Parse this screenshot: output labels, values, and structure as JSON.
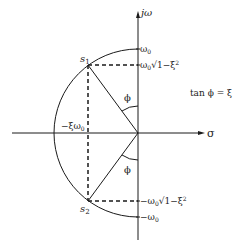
{
  "diagram": {
    "axes": {
      "vertical_label": "jω",
      "horizontal_label": "σ"
    },
    "points": {
      "upper_pole": "s",
      "upper_pole_sub": "1",
      "lower_pole": "s",
      "lower_pole_sub": "2"
    },
    "ticks": {
      "top_omega": "ω",
      "top_omega_sub": "0",
      "upper_damped": "ω",
      "upper_damped_sub": "0",
      "upper_damped_root": "√1−ξ",
      "upper_damped_exp": "2",
      "lower_damped": "−ω",
      "lower_damped_sub": "0",
      "lower_damped_root": "√1−ξ",
      "lower_damped_exp": "2",
      "bottom_omega": "−ω",
      "bottom_omega_sub": "0",
      "real_part": "−ξω",
      "real_part_sub": "0"
    },
    "angles": {
      "upper": "ϕ",
      "lower": "ϕ"
    },
    "equation": "tan ϕ = ξ",
    "colors": {
      "line": "#1a1a1a",
      "background": "#ffffff"
    }
  }
}
